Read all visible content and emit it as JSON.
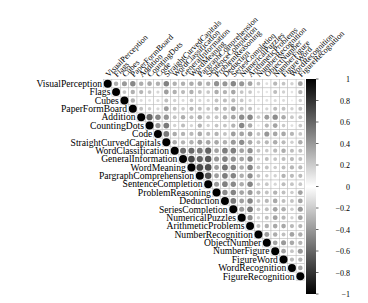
{
  "chart_data": {
    "type": "heatmap",
    "subtype": "correlation-matrix-upper-circle",
    "title": "",
    "xlabel": "",
    "ylabel": "",
    "variables": [
      "VisualPerception",
      "Flags",
      "Cubes",
      "PaperFormBoard",
      "Addition",
      "CountingDots",
      "Code",
      "StraightCurvedCapitals",
      "WordClassification",
      "GeneralInformation",
      "WordMeaning",
      "PargraphComprehension",
      "SentenceCompletion",
      "ProblemReasoning",
      "Deduction",
      "SeriesCompletion",
      "NumericalPuzzles",
      "ArithmeticProblems",
      "NumberRecognition",
      "ObjectNumber",
      "NumberFigure",
      "FigureWord",
      "WordRecognition",
      "FigureRecognition"
    ],
    "matrix": [
      [
        1.0,
        0.32,
        0.4,
        0.47,
        0.32,
        0.34,
        0.31,
        0.49,
        0.31,
        0.31,
        0.33,
        0.34,
        0.31,
        0.43,
        0.41,
        0.47,
        0.41,
        0.36,
        0.23,
        0.13,
        0.28,
        0.23,
        0.18,
        0.37
      ],
      [
        0.32,
        1.0,
        0.23,
        0.31,
        0.29,
        0.23,
        0.16,
        0.38,
        0.31,
        0.27,
        0.31,
        0.25,
        0.22,
        0.32,
        0.3,
        0.35,
        0.23,
        0.22,
        0.12,
        0.1,
        0.26,
        0.18,
        0.11,
        0.3
      ],
      [
        0.4,
        0.23,
        1.0,
        0.31,
        0.14,
        0.12,
        0.15,
        0.25,
        0.18,
        0.14,
        0.21,
        0.16,
        0.16,
        0.24,
        0.26,
        0.27,
        0.22,
        0.16,
        0.11,
        0.12,
        0.15,
        0.14,
        0.07,
        0.19
      ],
      [
        0.47,
        0.31,
        0.31,
        1.0,
        0.24,
        0.19,
        0.16,
        0.39,
        0.24,
        0.21,
        0.29,
        0.25,
        0.23,
        0.29,
        0.28,
        0.39,
        0.26,
        0.25,
        0.13,
        0.17,
        0.26,
        0.24,
        0.18,
        0.25
      ],
      [
        0.32,
        0.29,
        0.14,
        0.24,
        1.0,
        0.61,
        0.48,
        0.42,
        0.24,
        0.32,
        0.26,
        0.33,
        0.24,
        0.24,
        0.31,
        0.36,
        0.45,
        0.47,
        0.21,
        0.38,
        0.45,
        0.33,
        0.22,
        0.24
      ],
      [
        0.34,
        0.23,
        0.12,
        0.19,
        0.61,
        1.0,
        0.43,
        0.52,
        0.18,
        0.26,
        0.17,
        0.3,
        0.18,
        0.23,
        0.23,
        0.3,
        0.47,
        0.33,
        0.1,
        0.28,
        0.36,
        0.21,
        0.13,
        0.22
      ],
      [
        0.31,
        0.16,
        0.15,
        0.16,
        0.48,
        0.43,
        1.0,
        0.53,
        0.33,
        0.3,
        0.28,
        0.34,
        0.28,
        0.3,
        0.24,
        0.38,
        0.36,
        0.38,
        0.24,
        0.41,
        0.35,
        0.34,
        0.29,
        0.23
      ],
      [
        0.49,
        0.38,
        0.25,
        0.39,
        0.42,
        0.52,
        0.53,
        1.0,
        0.33,
        0.3,
        0.31,
        0.38,
        0.35,
        0.34,
        0.31,
        0.4,
        0.45,
        0.34,
        0.24,
        0.28,
        0.32,
        0.27,
        0.19,
        0.32
      ],
      [
        0.31,
        0.31,
        0.18,
        0.24,
        0.24,
        0.18,
        0.33,
        0.33,
        1.0,
        0.57,
        0.59,
        0.53,
        0.61,
        0.37,
        0.51,
        0.5,
        0.37,
        0.44,
        0.24,
        0.21,
        0.27,
        0.32,
        0.26,
        0.26
      ],
      [
        0.31,
        0.27,
        0.14,
        0.21,
        0.32,
        0.26,
        0.3,
        0.3,
        0.57,
        1.0,
        0.72,
        0.62,
        0.66,
        0.41,
        0.5,
        0.43,
        0.36,
        0.46,
        0.17,
        0.25,
        0.23,
        0.26,
        0.27,
        0.25
      ],
      [
        0.33,
        0.31,
        0.21,
        0.29,
        0.26,
        0.17,
        0.28,
        0.31,
        0.59,
        0.72,
        1.0,
        0.72,
        0.7,
        0.39,
        0.55,
        0.48,
        0.33,
        0.48,
        0.22,
        0.24,
        0.2,
        0.25,
        0.29,
        0.28
      ],
      [
        0.34,
        0.25,
        0.16,
        0.25,
        0.33,
        0.3,
        0.34,
        0.38,
        0.53,
        0.62,
        0.72,
        1.0,
        0.69,
        0.38,
        0.51,
        0.48,
        0.32,
        0.44,
        0.23,
        0.2,
        0.18,
        0.3,
        0.27,
        0.27
      ],
      [
        0.31,
        0.22,
        0.16,
        0.23,
        0.24,
        0.18,
        0.28,
        0.35,
        0.61,
        0.66,
        0.7,
        0.69,
        1.0,
        0.4,
        0.5,
        0.46,
        0.33,
        0.48,
        0.2,
        0.22,
        0.16,
        0.26,
        0.23,
        0.22
      ],
      [
        0.43,
        0.32,
        0.24,
        0.29,
        0.24,
        0.23,
        0.3,
        0.34,
        0.37,
        0.41,
        0.39,
        0.38,
        0.4,
        1.0,
        0.46,
        0.48,
        0.36,
        0.4,
        0.28,
        0.24,
        0.3,
        0.25,
        0.2,
        0.37
      ],
      [
        0.41,
        0.3,
        0.26,
        0.28,
        0.31,
        0.23,
        0.24,
        0.31,
        0.51,
        0.5,
        0.55,
        0.51,
        0.5,
        0.46,
        1.0,
        0.52,
        0.38,
        0.48,
        0.24,
        0.28,
        0.34,
        0.26,
        0.24,
        0.36
      ],
      [
        0.47,
        0.35,
        0.27,
        0.39,
        0.36,
        0.3,
        0.38,
        0.4,
        0.5,
        0.43,
        0.48,
        0.48,
        0.46,
        0.48,
        0.52,
        1.0,
        0.4,
        0.53,
        0.22,
        0.25,
        0.36,
        0.32,
        0.2,
        0.4
      ],
      [
        0.41,
        0.23,
        0.22,
        0.26,
        0.45,
        0.47,
        0.36,
        0.45,
        0.37,
        0.36,
        0.33,
        0.32,
        0.33,
        0.36,
        0.38,
        0.4,
        1.0,
        0.43,
        0.18,
        0.25,
        0.37,
        0.28,
        0.18,
        0.36
      ],
      [
        0.36,
        0.22,
        0.16,
        0.25,
        0.47,
        0.33,
        0.38,
        0.34,
        0.44,
        0.46,
        0.48,
        0.44,
        0.48,
        0.4,
        0.48,
        0.53,
        0.43,
        1.0,
        0.26,
        0.31,
        0.34,
        0.34,
        0.28,
        0.29
      ],
      [
        0.23,
        0.12,
        0.11,
        0.13,
        0.21,
        0.1,
        0.24,
        0.24,
        0.24,
        0.17,
        0.22,
        0.23,
        0.2,
        0.28,
        0.24,
        0.22,
        0.18,
        0.26,
        1.0,
        0.39,
        0.32,
        0.25,
        0.36,
        0.32
      ],
      [
        0.13,
        0.1,
        0.12,
        0.17,
        0.38,
        0.28,
        0.41,
        0.28,
        0.21,
        0.25,
        0.24,
        0.2,
        0.22,
        0.24,
        0.28,
        0.25,
        0.25,
        0.31,
        0.39,
        1.0,
        0.36,
        0.4,
        0.34,
        0.3
      ],
      [
        0.28,
        0.26,
        0.15,
        0.26,
        0.45,
        0.36,
        0.35,
        0.32,
        0.27,
        0.23,
        0.2,
        0.18,
        0.16,
        0.3,
        0.34,
        0.36,
        0.37,
        0.34,
        0.32,
        0.36,
        1.0,
        0.36,
        0.23,
        0.4
      ],
      [
        0.23,
        0.18,
        0.14,
        0.24,
        0.33,
        0.21,
        0.34,
        0.27,
        0.32,
        0.26,
        0.25,
        0.3,
        0.26,
        0.25,
        0.26,
        0.32,
        0.28,
        0.34,
        0.25,
        0.4,
        0.36,
        1.0,
        0.28,
        0.3
      ],
      [
        0.18,
        0.11,
        0.07,
        0.18,
        0.22,
        0.13,
        0.29,
        0.19,
        0.26,
        0.27,
        0.29,
        0.27,
        0.23,
        0.2,
        0.24,
        0.2,
        0.18,
        0.28,
        0.36,
        0.34,
        0.23,
        0.28,
        1.0,
        0.35
      ],
      [
        0.37,
        0.3,
        0.19,
        0.25,
        0.24,
        0.22,
        0.23,
        0.32,
        0.26,
        0.25,
        0.28,
        0.27,
        0.22,
        0.37,
        0.36,
        0.4,
        0.36,
        0.29,
        0.32,
        0.3,
        0.4,
        0.3,
        0.35,
        1.0
      ]
    ],
    "colorbar": {
      "range": [
        -1,
        1
      ],
      "ticks": [
        "1",
        "0.8",
        "0.6",
        "0.4",
        "0.2",
        "0",
        "−0.2",
        "−0.4",
        "−0.6",
        "−0.8",
        "−1"
      ],
      "colors": {
        "negative_end": "#000000",
        "middle": "#ffffff",
        "positive_end": "#000000"
      }
    },
    "layout": {
      "grid": true,
      "shape": "upper-triangle",
      "glyph": "circle",
      "legend_position": "right",
      "label_rotation_deg": -45
    }
  }
}
